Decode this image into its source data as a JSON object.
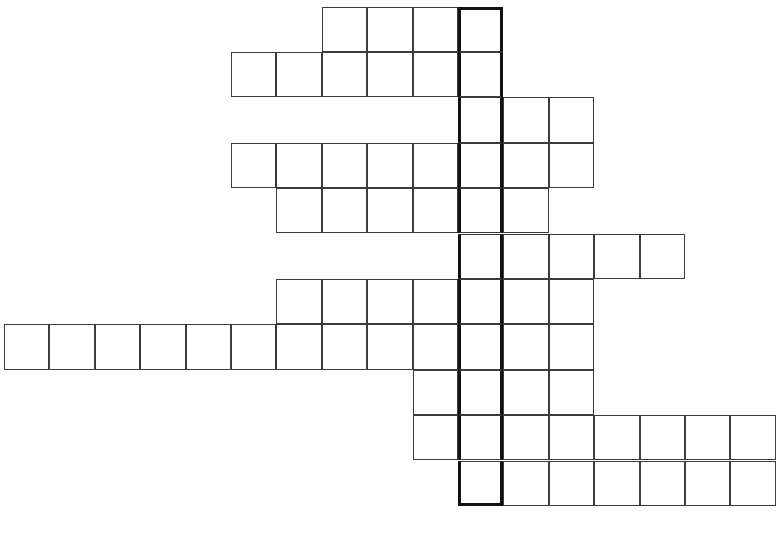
{
  "puzzle": {
    "kind": "crossword-grid",
    "title": "",
    "width_px": 780,
    "height_px": 534,
    "background_color": "#ffffff",
    "line_color": "#3b3b3b",
    "highlight_color": "#111111",
    "cell_size_px": 45.4,
    "origin_x_px": 4,
    "origin_y_px": 6.5,
    "highlight_column_index": 10,
    "highlight_row_start": 1,
    "highlight_row_end": 11,
    "total_cells": 71,
    "row_count": 11,
    "column_count": 17,
    "rows": [
      {
        "index": 1,
        "start_col": 7,
        "length": 4,
        "letters": [
          "",
          "",
          "",
          ""
        ]
      },
      {
        "index": 2,
        "start_col": 5,
        "length": 6,
        "letters": [
          "",
          "",
          "",
          "",
          "",
          ""
        ]
      },
      {
        "index": 3,
        "start_col": 10,
        "length": 3,
        "letters": [
          "",
          "",
          ""
        ]
      },
      {
        "index": 4,
        "start_col": 5,
        "length": 8,
        "letters": [
          "",
          "",
          "",
          "",
          "",
          "",
          "",
          ""
        ]
      },
      {
        "index": 5,
        "start_col": 6,
        "length": 6,
        "letters": [
          "",
          "",
          "",
          "",
          "",
          ""
        ]
      },
      {
        "index": 6,
        "start_col": 10,
        "length": 5,
        "letters": [
          "",
          "",
          "",
          "",
          ""
        ]
      },
      {
        "index": 7,
        "start_col": 6,
        "length": 7,
        "letters": [
          "",
          "",
          "",
          "",
          "",
          "",
          ""
        ]
      },
      {
        "index": 8,
        "start_col": 0,
        "length": 13,
        "letters": [
          "",
          "",
          "",
          "",
          "",
          "",
          "",
          "",
          "",
          "",
          "",
          "",
          ""
        ]
      },
      {
        "index": 9,
        "start_col": 9,
        "length": 4,
        "letters": [
          "",
          "",
          "",
          ""
        ]
      },
      {
        "index": 10,
        "start_col": 9,
        "length": 8,
        "letters": [
          "",
          "",
          "",
          "",
          "",
          "",
          "",
          ""
        ]
      },
      {
        "index": 11,
        "start_col": 10,
        "length": 7,
        "letters": [
          "",
          "",
          "",
          "",
          "",
          "",
          ""
        ]
      }
    ]
  }
}
